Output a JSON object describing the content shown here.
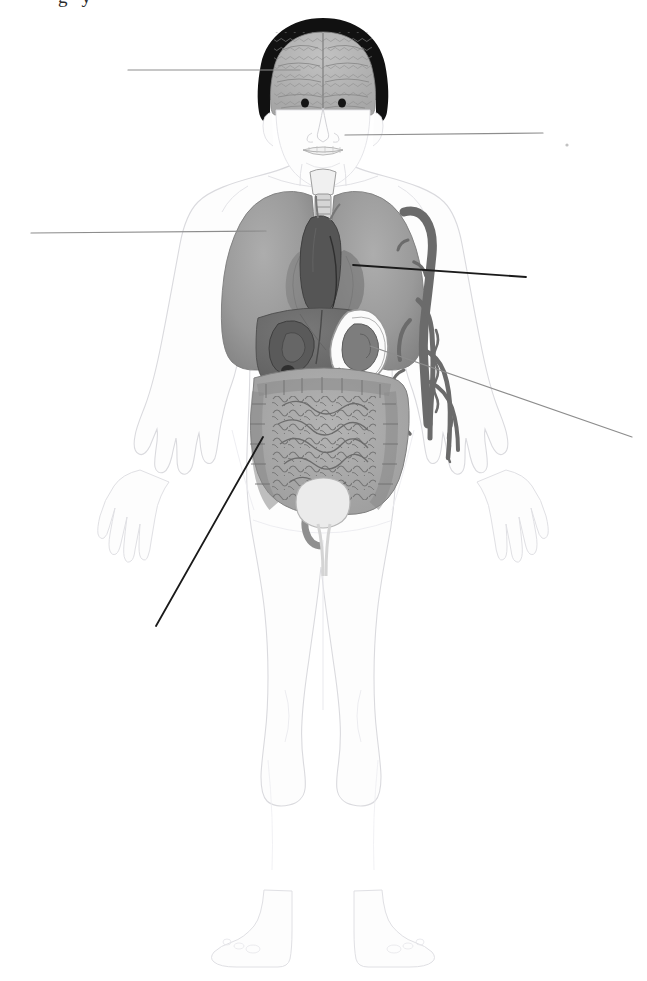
{
  "figure": {
    "background_color": "#ffffff",
    "width": 647,
    "height": 981
  },
  "cropped_caption_fragment": "gy",
  "palette": {
    "body_outline": "#d8d8dc",
    "body_fill": "#fdfdfd",
    "hair": "#111111",
    "brain": "#b4b4b4",
    "brain_detail": "#8c8c8c",
    "lung": "#9a9a9a",
    "lung_shade": "#7e7e7e",
    "heart": "#5c5c5c",
    "trachea": "#c9c9c9",
    "liver": "#6d6d6d",
    "liver_dark": "#4f4f4f",
    "stomach": "#8f8f8f",
    "intestine": "#a9a9a9",
    "intestine_line": "#6f6f6f",
    "bladder": "#e3e3e3",
    "aorta": "#6b6b6b",
    "leader_dark": "#1a1a1a",
    "leader_light": "#8d8d8d"
  },
  "organs": [
    {
      "id": "brain",
      "name": "Brain",
      "color": "#b4b4b4"
    },
    {
      "id": "mouth",
      "name": "Mouth / Oral cavity",
      "color": "#efefef"
    },
    {
      "id": "trachea",
      "name": "Trachea",
      "color": "#c9c9c9"
    },
    {
      "id": "lung-right",
      "name": "Right lung",
      "color": "#9a9a9a"
    },
    {
      "id": "lung-left",
      "name": "Left lung",
      "color": "#9a9a9a"
    },
    {
      "id": "heart",
      "name": "Heart",
      "color": "#5c5c5c"
    },
    {
      "id": "liver",
      "name": "Liver",
      "color": "#6d6d6d"
    },
    {
      "id": "stomach",
      "name": "Stomach",
      "color": "#8f8f8f"
    },
    {
      "id": "spleen",
      "name": "Spleen",
      "color": "#7a7a7a"
    },
    {
      "id": "intestines",
      "name": "Intestines",
      "color": "#a9a9a9"
    },
    {
      "id": "bladder",
      "name": "Urinary bladder",
      "color": "#e3e3e3"
    },
    {
      "id": "aorta",
      "name": "Aorta and arteries",
      "color": "#6b6b6b"
    }
  ],
  "leader_lines": [
    {
      "id": "brain-leader",
      "target_organ": "Brain",
      "label": "",
      "x1": 128,
      "y1": 70,
      "x2": 300,
      "y2": 70,
      "color": "#8d8d8d",
      "width": 1.2,
      "label_side": "left"
    },
    {
      "id": "mouth-leader",
      "target_organ": "Mouth",
      "label": "",
      "x1": 345,
      "y1": 135,
      "x2": 543,
      "y2": 133,
      "color": "#8d8d8d",
      "width": 1.2,
      "label_side": "right"
    },
    {
      "id": "lung-leader",
      "target_organ": "Lung",
      "label": "",
      "x1": 31,
      "y1": 233,
      "x2": 266,
      "y2": 231,
      "color": "#8d8d8d",
      "width": 1.2,
      "label_side": "left"
    },
    {
      "id": "heart-leader",
      "target_organ": "Heart",
      "label": "",
      "x1": 353,
      "y1": 265,
      "x2": 526,
      "y2": 277,
      "color": "#1a1a1a",
      "width": 1.8,
      "label_side": "right"
    },
    {
      "id": "stomach-leader",
      "target_organ": "Stomach / Spleen",
      "label": "",
      "x1": 370,
      "y1": 346,
      "x2": 632,
      "y2": 437,
      "color": "#8d8d8d",
      "width": 1.2,
      "label_side": "right"
    },
    {
      "id": "intestine-leader",
      "target_organ": "Intestines",
      "label": "",
      "x1": 263,
      "y1": 437,
      "x2": 156,
      "y2": 626,
      "color": "#1a1a1a",
      "width": 1.8,
      "label_side": "left"
    }
  ],
  "marks": [
    {
      "id": "stray-dot",
      "x": 567,
      "y": 145,
      "r": 1.6,
      "color": "#c2c2c2"
    }
  ]
}
